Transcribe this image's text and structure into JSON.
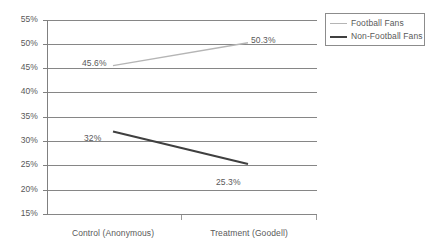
{
  "chart_data": {
    "type": "line",
    "title": "",
    "subtitle": "",
    "xlabel": "",
    "ylabel": "",
    "categories": [
      "Control (Anonymous)",
      "Treatment (Goodell)"
    ],
    "series": [
      {
        "name": "Football Fans",
        "color": "#b5b5b5",
        "values": [
          45.6,
          25.3
        ],
        "point_labels": [
          "45.6%",
          "50.3%"
        ]
      },
      {
        "name": "Non-Football Fans",
        "color": "#404040",
        "values": [
          32.0,
          25.3
        ],
        "point_labels": [
          "32%",
          "25.3%"
        ]
      }
    ],
    "series_values": {
      "football_fans": [
        45.6,
        50.3
      ],
      "non_football_fans": [
        32.0,
        25.3
      ]
    },
    "ylim": [
      15,
      55
    ],
    "ytick_values": [
      55,
      50,
      45,
      40,
      35,
      30,
      25,
      20,
      15
    ],
    "ytick_labels": [
      "55%",
      "50%",
      "45%",
      "40%",
      "35%",
      "30%",
      "25%",
      "20%",
      "15%"
    ],
    "grid": true,
    "legend_position": "top-right",
    "legend_entries": [
      "Football Fans",
      "Non-Football Fans"
    ]
  },
  "legend": {
    "items": [
      {
        "label": "Football Fans",
        "color": "#b5b5b5"
      },
      {
        "label": "Non-Football Fans",
        "color": "#404040"
      }
    ]
  },
  "axes": {
    "y_labels": [
      "55%",
      "50%",
      "45%",
      "40%",
      "35%",
      "30%",
      "25%",
      "20%",
      "15%"
    ],
    "x_labels": [
      "Control (Anonymous)",
      "Treatment (Goodell)"
    ]
  },
  "annotations": {
    "ff_left": "45.6%",
    "ff_right": "50.3%",
    "nff_left": "32%",
    "nff_right": "25.3%"
  }
}
